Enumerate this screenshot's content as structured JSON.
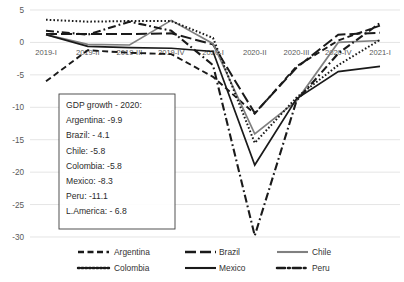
{
  "chart_data": {
    "type": "line",
    "title": "",
    "xlabel": "",
    "ylabel": "",
    "categories": [
      "2019-I",
      "2019-II",
      "2019-III",
      "2019-IV",
      "2020-I",
      "2020-II",
      "2020-III",
      "2020-IV",
      "2021-I"
    ],
    "ylim": [
      -32,
      5
    ],
    "yticks": [
      5,
      0,
      -5,
      -10,
      -15,
      -20,
      -25,
      -30
    ],
    "ytick_labels": [
      "5",
      "0",
      "-5",
      "-10",
      "-15",
      "-20",
      "-25",
      "-30"
    ],
    "grid": true,
    "legend_position": "bottom",
    "series": [
      {
        "name": "Argentina",
        "style": "dashed",
        "color": "#1a1a1a",
        "values": [
          -6.0,
          -1.2,
          -1.6,
          -1.8,
          -5.3,
          -11.0,
          -3.7,
          0.3,
          2.6
        ]
      },
      {
        "name": "Brazil",
        "style": "long-dash",
        "color": "#1a1a1a",
        "values": [
          1.3,
          1.3,
          1.3,
          1.4,
          -0.3,
          -10.9,
          -3.9,
          1.2,
          1.5
        ]
      },
      {
        "name": "Chile",
        "style": "solid",
        "color": "#808080",
        "values": [
          1.2,
          -0.3,
          -0.4,
          3.4,
          -0.2,
          -14.1,
          -9.0,
          0.0,
          0.3
        ]
      },
      {
        "name": "Colombia",
        "style": "dotted",
        "color": "#1a1a1a",
        "values": [
          3.5,
          3.2,
          3.3,
          3.3,
          0.7,
          -15.5,
          -8.5,
          -3.5,
          0.4
        ]
      },
      {
        "name": "Mexico",
        "style": "solid",
        "color": "#1a1a1a",
        "values": [
          1.2,
          -0.6,
          -0.8,
          -0.9,
          -1.4,
          -18.9,
          -8.7,
          -4.5,
          -3.7
        ]
      },
      {
        "name": "Peru",
        "style": "dash-dot",
        "color": "#1a1a1a",
        "values": [
          1.8,
          1.2,
          3.2,
          1.8,
          -3.5,
          -29.8,
          -9.0,
          -1.7,
          3.0
        ]
      }
    ]
  },
  "annotation": {
    "name": "gdp-growth-box",
    "lines": [
      "GDP growth - 2020:",
      "Argentina: -9.9",
      "Brazil: - 4.1",
      "Chile: -5.8",
      "Colombia: -5.8",
      "Mexico: -8.3",
      "Peru: -11.1",
      "L.America: - 6.8"
    ]
  },
  "legend": {
    "entries": [
      {
        "label": "Argentina",
        "style": "dashed",
        "color": "#1a1a1a"
      },
      {
        "label": "Brazil",
        "style": "long-dash",
        "color": "#1a1a1a"
      },
      {
        "label": "Chile",
        "style": "solid",
        "color": "#808080"
      },
      {
        "label": "Colombia",
        "style": "dotted",
        "color": "#1a1a1a"
      },
      {
        "label": "Mexico",
        "style": "solid",
        "color": "#1a1a1a"
      },
      {
        "label": "Peru",
        "style": "dash-dot",
        "color": "#1a1a1a"
      }
    ]
  },
  "colors": {
    "gridline": "#d9d9d9",
    "tick_text": "#595959",
    "series_black": "#1a1a1a",
    "series_gray": "#808080",
    "annotation_border": "#3f3f3f",
    "background": "#ffffff"
  }
}
